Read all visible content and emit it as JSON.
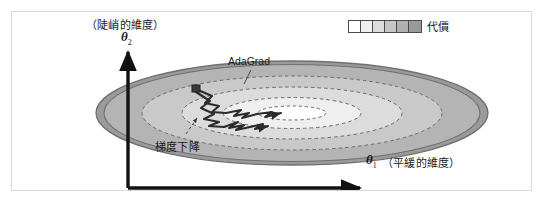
{
  "figure": {
    "axes": {
      "y": {
        "symbol": "θ",
        "subscript": "2",
        "caption": "（陡峭的維度）"
      },
      "x": {
        "symbol": "θ",
        "subscript": "1",
        "caption": "（平緩的維度）"
      }
    },
    "legend": {
      "label": "代價",
      "cells": [
        "#ffffff",
        "#f0f0f0",
        "#dcdcdc",
        "#c6c6c6",
        "#b0b0b0",
        "#9a9a9a"
      ]
    },
    "annotations": {
      "adagrad": "AdaGrad",
      "gradient_descent": "梯度下降"
    },
    "colors": {
      "frame_border": "#d8d8d8",
      "axis": "#111111",
      "contour_rim": "#8a8a8a",
      "contour_dash": "#6e6e6e",
      "path": "#2b2b2b",
      "background": "#ffffff"
    }
  },
  "chart_data": {
    "type": "contour",
    "title": "",
    "xlabel": "θ1（平緩的維度）",
    "ylabel": "θ2（陡峭的維度）",
    "contour_levels": [
      {
        "name": "outermost",
        "rx": 196,
        "ry": 52,
        "fill": "#9a9a9a",
        "style": "solid-rim"
      },
      {
        "name": "level-2",
        "rx": 183,
        "ry": 46,
        "fill": "#b4b4b4",
        "style": "solid"
      },
      {
        "name": "level-3",
        "rx": 148,
        "ry": 36,
        "fill": "#c8c8c8",
        "style": "dashed"
      },
      {
        "name": "level-4",
        "rx": 108,
        "ry": 25,
        "fill": "#dcdcdc",
        "style": "dashed"
      },
      {
        "name": "level-5",
        "rx": 68,
        "ry": 15,
        "fill": "#efefef",
        "style": "dashed"
      },
      {
        "name": "innermost",
        "rx": 34,
        "ry": 7,
        "fill": "#ffffff",
        "style": "dashed"
      }
    ],
    "minimum": {
      "x": 292,
      "y": 113
    },
    "series": [
      {
        "name": "梯度下降",
        "style": "zigzag",
        "note": "oscillates strongly across the steep θ2 axis before drifting toward the minimum"
      },
      {
        "name": "AdaGrad",
        "style": "zigzag",
        "note": "damped oscillation, heads more directly toward the minimum"
      }
    ],
    "legend": {
      "title": "代價",
      "position": "top-right",
      "scale": "white = low cost, dark gray = high cost"
    },
    "grid": false
  }
}
